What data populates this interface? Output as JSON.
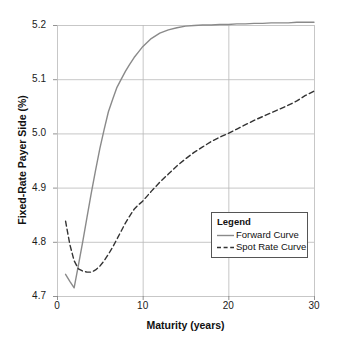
{
  "chart_data": {
    "type": "line",
    "title": "",
    "xlabel": "Maturity (years)",
    "ylabel": "Fixed-Rate Payer Side (%)",
    "xlim": [
      0,
      30
    ],
    "ylim": [
      4.7,
      5.2
    ],
    "xticks": [
      "0",
      "10",
      "20",
      "30"
    ],
    "xtick_values": [
      0,
      10,
      20,
      30
    ],
    "yticks": [
      "4.7",
      "4.8",
      "4.9",
      "5.0",
      "5.1",
      "5.2"
    ],
    "ytick_values": [
      4.7,
      4.8,
      4.9,
      5.0,
      5.1,
      5.2
    ],
    "grid": true,
    "legend_position": "lower right",
    "legend_title": "Legend",
    "x": [
      1,
      1.5,
      2,
      2.5,
      3,
      3.5,
      4,
      4.5,
      5,
      5.5,
      6,
      6.5,
      7,
      7.5,
      8,
      8.5,
      9,
      9.5,
      10,
      11,
      12,
      13,
      14,
      15,
      16,
      17,
      18,
      19,
      20,
      21,
      22,
      23,
      24,
      25,
      26,
      27,
      28,
      29,
      30
    ],
    "series": [
      {
        "name": "Forward Curve",
        "style": "solid",
        "color": "#8a8a8a",
        "values": [
          4.74,
          4.727,
          4.715,
          4.757,
          4.8,
          4.845,
          4.89,
          4.932,
          4.972,
          5.007,
          5.04,
          5.063,
          5.085,
          5.1,
          5.115,
          5.128,
          5.14,
          5.15,
          5.16,
          5.175,
          5.185,
          5.191,
          5.195,
          5.198,
          5.199,
          5.2,
          5.2,
          5.201,
          5.201,
          5.202,
          5.202,
          5.203,
          5.203,
          5.204,
          5.204,
          5.204,
          5.205,
          5.205,
          5.205
        ]
      },
      {
        "name": "Spot Rate Curve",
        "style": "dashed",
        "color": "#333333",
        "values": [
          4.838,
          4.795,
          4.765,
          4.75,
          4.746,
          4.744,
          4.744,
          4.748,
          4.755,
          4.765,
          4.777,
          4.79,
          4.805,
          4.82,
          4.835,
          4.848,
          4.86,
          4.868,
          4.875,
          4.893,
          4.91,
          4.925,
          4.94,
          4.953,
          4.965,
          4.975,
          4.985,
          4.993,
          5.0,
          5.008,
          5.016,
          5.024,
          5.031,
          5.038,
          5.045,
          5.052,
          5.06,
          5.07,
          5.078
        ]
      }
    ]
  }
}
